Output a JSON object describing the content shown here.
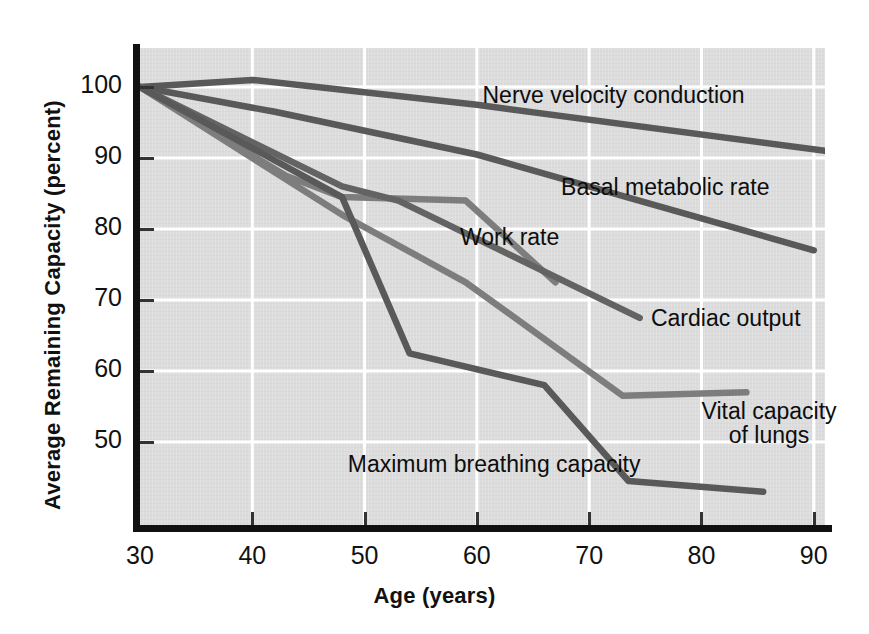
{
  "chart_data": {
    "type": "line",
    "title": "",
    "xlabel": "Age (years)",
    "ylabel": "Average Remaining Capacity (percent)",
    "xlim": [
      30,
      91
    ],
    "ylim": [
      42,
      103
    ],
    "grid": true,
    "legend_position": "inline-labels",
    "xticks": [
      30,
      40,
      50,
      60,
      70,
      80,
      90
    ],
    "yticks": [
      50,
      60,
      70,
      80,
      90,
      100
    ],
    "xtick_labels": [
      "30",
      "40",
      "50",
      "60",
      "70",
      "80",
      "90"
    ],
    "ytick_labels": [
      "50",
      "60",
      "70",
      "80",
      "90",
      "100"
    ],
    "series": [
      {
        "name": "Nerve velocity conduction",
        "color": "#595959",
        "x": [
          30,
          40,
          60,
          91
        ],
        "values": [
          100,
          101,
          97.5,
          91
        ]
      },
      {
        "name": "Basal metabolic rate",
        "color": "#595959",
        "x": [
          30,
          42,
          60,
          90
        ],
        "values": [
          100,
          96.5,
          90.5,
          77
        ]
      },
      {
        "name": "Work rate",
        "color": "#7d7d7d",
        "x": [
          30,
          43,
          48,
          59,
          67
        ],
        "values": [
          100,
          87.5,
          84.5,
          84,
          72.5
        ]
      },
      {
        "name": "Cardiac output",
        "color": "#636363",
        "x": [
          30,
          48,
          53,
          74.5
        ],
        "values": [
          100,
          86,
          84,
          67.5
        ]
      },
      {
        "name": "Vital capacity of lungs",
        "color": "#7d7d7d",
        "x": [
          30,
          48,
          59,
          73,
          84
        ],
        "values": [
          100,
          82,
          72.5,
          56.5,
          57
        ]
      },
      {
        "name": "Maximum breathing capacity",
        "color": "#595959",
        "x": [
          30,
          48,
          54,
          66,
          73.5,
          85.5
        ],
        "values": [
          100,
          84.5,
          62.5,
          58,
          44.5,
          43
        ]
      }
    ],
    "annotations": [
      {
        "text": "Nerve velocity conduction",
        "x": 60.5,
        "y": 98.5
      },
      {
        "text": "Basal metabolic rate",
        "x": 67.5,
        "y": 85.5
      },
      {
        "text": "Work rate",
        "x": 58.5,
        "y": 78.5
      },
      {
        "text": "Cardiac output",
        "x": 75.5,
        "y": 67
      },
      {
        "text": "Vital capacity\nof lungs",
        "x": 80,
        "y": 54
      },
      {
        "text": "Maximum breathing capacity",
        "x": 48.5,
        "y": 46.5
      }
    ]
  }
}
